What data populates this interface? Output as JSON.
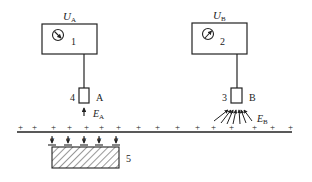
{
  "diagram": {
    "type": "electrostatic-field-measurement-schematic",
    "colors": {
      "stroke": "#222222",
      "background": "#ffffff"
    },
    "meter_a": {
      "label_main": "U",
      "label_sub": "A",
      "number": "1"
    },
    "meter_b": {
      "label_main": "U",
      "label_sub": "B",
      "number": "2"
    },
    "probe_a": {
      "number": "4",
      "letter": "A",
      "field_main": "E",
      "field_sub": "A"
    },
    "probe_b": {
      "number": "3",
      "letter": "B",
      "field_main": "E",
      "field_sub": "B"
    },
    "surface": {
      "charge_symbol": "+",
      "charge_count": 17
    },
    "object": {
      "number": "5"
    }
  }
}
